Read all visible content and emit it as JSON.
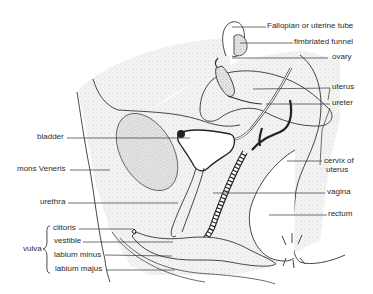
{
  "labels": {
    "fallopian_tube": "Fallopian or uterine tube",
    "fimbriated_funnel": "fimbriated funnel",
    "ovary": "ovary",
    "uterus": "uterus",
    "ureter": "ureter",
    "bladder": "bladder",
    "mons_veneris": "mons Veneris",
    "cervix_line1": "cervix of",
    "cervix_line2": "uterus",
    "vagina": "vagina",
    "urethra": "urethra",
    "rectum": "rectum",
    "vulva": "vulva",
    "clitoris": "clitoris",
    "vestible": "vestible",
    "labium_minus": "labium minus",
    "labium_majus": "labium majus"
  },
  "colors": {
    "ink": "#2a2a2a",
    "stipple": "#e9e9e9",
    "background": "#ffffff"
  }
}
